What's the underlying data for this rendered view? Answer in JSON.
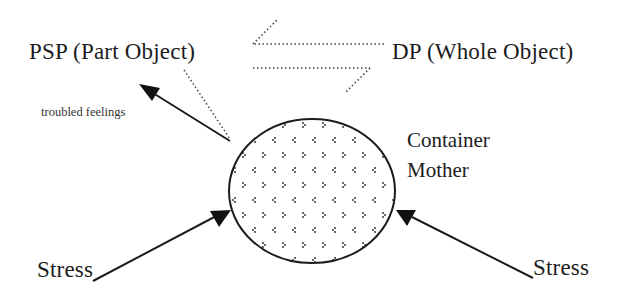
{
  "diagram": {
    "labels": {
      "psp": "PSP (Part Object)",
      "dp": "DP (Whole Object)",
      "troubled": "troubled feelings",
      "container_line1": "Container",
      "container_line2": "Mother",
      "stress_left": "Stress",
      "stress_right": "Stress"
    },
    "nodes": [
      {
        "id": "container",
        "shape": "ellipse",
        "fill": "dotted-pattern",
        "label": "Container Mother"
      }
    ],
    "edges": [
      {
        "from": "container",
        "to": "psp",
        "label": "troubled feelings",
        "style": "solid-arrow"
      },
      {
        "from": "container",
        "to": "psp",
        "style": "dotted-line"
      },
      {
        "from": "dp",
        "to": "psp",
        "style": "dotted-half-arrow"
      },
      {
        "from": "psp",
        "to": "dp",
        "style": "dotted-half-arrow"
      },
      {
        "from": "stress_left",
        "to": "container",
        "style": "solid-arrow"
      },
      {
        "from": "stress_right",
        "to": "container",
        "style": "solid-arrow"
      }
    ],
    "colors": {
      "ink": "#1c1c1c",
      "background": "#ffffff"
    }
  }
}
